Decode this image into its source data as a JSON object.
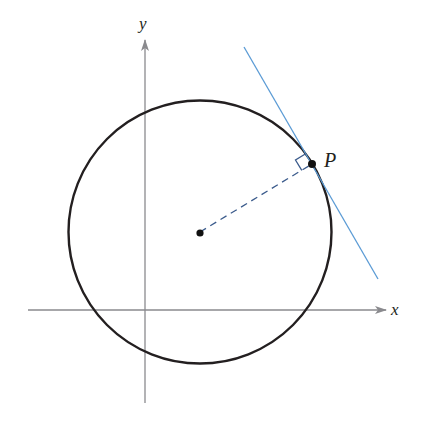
{
  "diagram": {
    "labels": {
      "x_axis": "x",
      "y_axis": "y",
      "point": "P"
    },
    "colors": {
      "axis": "#8a8a8e",
      "circle": "#231f20",
      "tangent": "#5b9bd5",
      "radius": "#3b5b8c",
      "point": "#111111",
      "right_angle": "#3b5b8c"
    },
    "geometry": {
      "center": [
        200,
        232
      ],
      "radius": 132,
      "point_P": [
        312,
        164
      ],
      "tangent_start": [
        244,
        47
      ],
      "tangent_end": [
        378,
        279
      ],
      "x_axis": {
        "from": [
          28,
          310
        ],
        "to": [
          386,
          310
        ]
      },
      "y_axis": {
        "from": [
          145,
          403
        ],
        "to": [
          145,
          40
        ]
      }
    },
    "elements": [
      "circle",
      "center-point",
      "dashed-radius",
      "tangent-line",
      "right-angle-mark",
      "point-P",
      "x-axis",
      "y-axis"
    ]
  }
}
